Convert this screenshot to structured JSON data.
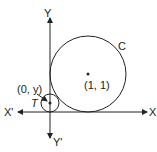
{
  "diagram": {
    "axes": {
      "x_positive_label": "X",
      "x_negative_label": "X'",
      "y_positive_label": "Y",
      "y_negative_label": "Y'"
    },
    "large_circle": {
      "label": "C",
      "center_label": "(1, 1)"
    },
    "small_circle": {
      "label": "T",
      "center_label": "(0, y)"
    },
    "colors": {
      "stroke": "#222222",
      "background": "#ffffff"
    }
  }
}
